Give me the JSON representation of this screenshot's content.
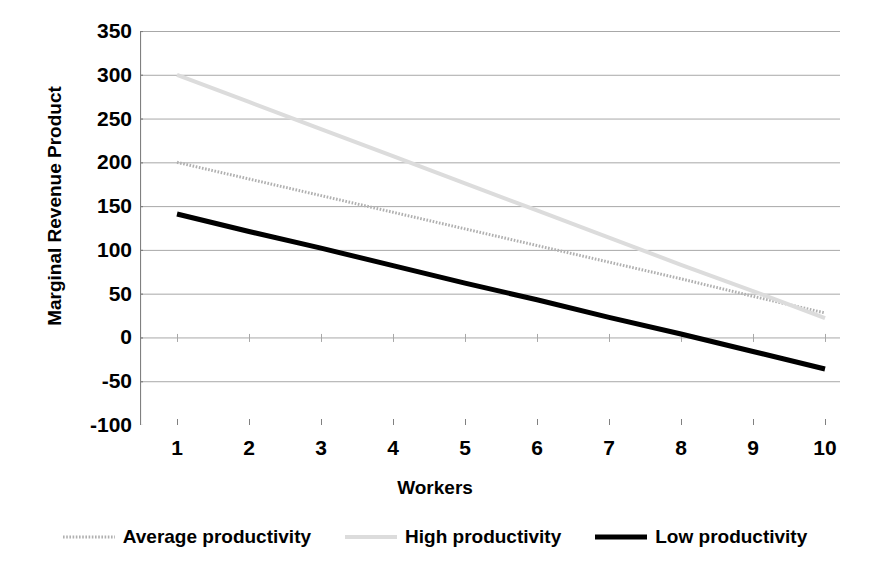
{
  "chart_data": {
    "type": "line",
    "title": "",
    "xlabel": "Workers",
    "ylabel": "Marginal Revenue Product",
    "categories": [
      1,
      2,
      3,
      4,
      5,
      6,
      7,
      8,
      9,
      10
    ],
    "x_tick_labels": [
      "1",
      "2",
      "3",
      "4",
      "5",
      "6",
      "7",
      "8",
      "9",
      "10"
    ],
    "y_tick_labels": [
      "350",
      "300",
      "250",
      "200",
      "150",
      "100",
      "50",
      "0",
      "-50",
      "-100"
    ],
    "y_ticks": [
      350,
      300,
      250,
      200,
      150,
      100,
      50,
      0,
      -50,
      -100
    ],
    "ylim": [
      -100,
      350
    ],
    "xlim": [
      1,
      10
    ],
    "grid": true,
    "grid_axis": "y",
    "legend_position": "bottom",
    "series": [
      {
        "name": "Average productivity",
        "color": "#b0b0b0",
        "style": "dotted",
        "width": 3,
        "values": [
          200,
          181,
          162,
          143,
          124,
          105,
          86,
          67,
          47,
          28
        ]
      },
      {
        "name": "High productivity",
        "color": "#dcdcdc",
        "style": "solid",
        "width": 4,
        "values": [
          300,
          269,
          238,
          207,
          176,
          145,
          114,
          83,
          53,
          22
        ]
      },
      {
        "name": "Low productivity",
        "color": "#000000",
        "style": "solid",
        "width": 5,
        "values": [
          141,
          121,
          102,
          82,
          62,
          43,
          23,
          4,
          -16,
          -36
        ]
      }
    ]
  },
  "legend": {
    "items": [
      {
        "label": "Average productivity",
        "color": "#b0b0b0",
        "style": "dotted",
        "width": 3
      },
      {
        "label": "High productivity",
        "color": "#dcdcdc",
        "style": "solid",
        "width": 4
      },
      {
        "label": "Low productivity",
        "color": "#000000",
        "style": "solid",
        "width": 5
      }
    ]
  },
  "axes": {
    "axis_line_color": "#808080",
    "grid_color": "#a8a8a8"
  }
}
